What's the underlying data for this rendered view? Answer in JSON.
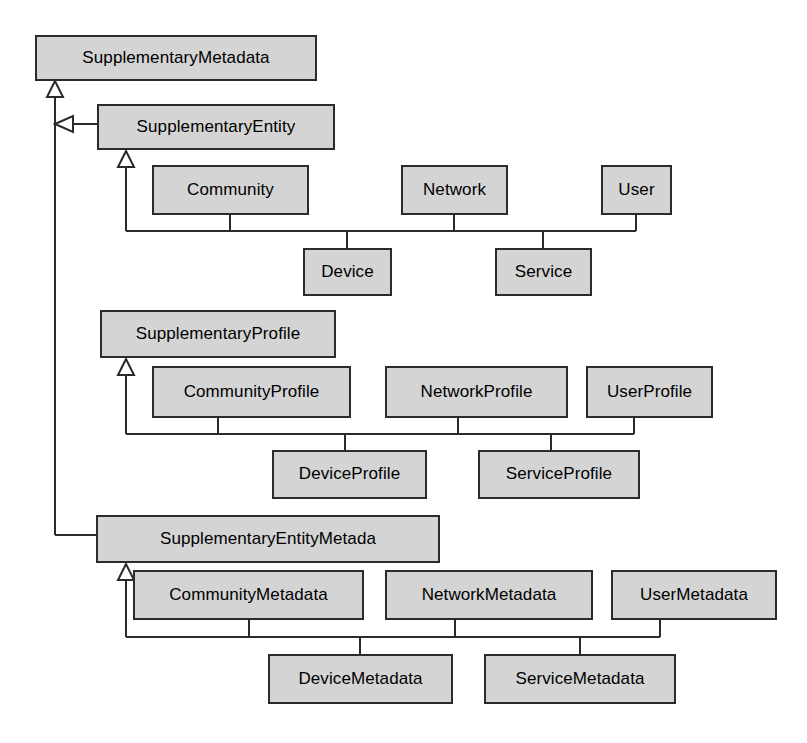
{
  "diagram": {
    "kind": "uml-class-diagram",
    "canvas": {
      "width": 807,
      "height": 743
    },
    "style": {
      "background": "#ffffff",
      "class_fill": "#d4d4d4",
      "class_border": "#2b2b2b",
      "edge_color": "#2b2b2b",
      "text_color": "#000000"
    },
    "classes": [
      {
        "id": "supplementary-metadata",
        "label": "SupplementaryMetadata",
        "x": 35,
        "y": 35,
        "w": 282,
        "h": 46
      },
      {
        "id": "supplementary-entity",
        "label": "SupplementaryEntity",
        "x": 97,
        "y": 104,
        "w": 238,
        "h": 46
      },
      {
        "id": "community",
        "label": "Community",
        "x": 152,
        "y": 165,
        "w": 157,
        "h": 50
      },
      {
        "id": "network",
        "label": "Network",
        "x": 401,
        "y": 165,
        "w": 107,
        "h": 50
      },
      {
        "id": "user",
        "label": "User",
        "x": 601,
        "y": 165,
        "w": 71,
        "h": 50
      },
      {
        "id": "device",
        "label": "Device",
        "x": 303,
        "y": 248,
        "w": 89,
        "h": 48
      },
      {
        "id": "service",
        "label": "Service",
        "x": 495,
        "y": 248,
        "w": 97,
        "h": 48
      },
      {
        "id": "supplementary-profile",
        "label": "SupplementaryProfile",
        "x": 100,
        "y": 310,
        "w": 236,
        "h": 48
      },
      {
        "id": "community-profile",
        "label": "CommunityProfile",
        "x": 152,
        "y": 366,
        "w": 199,
        "h": 52
      },
      {
        "id": "network-profile",
        "label": "NetworkProfile",
        "x": 385,
        "y": 366,
        "w": 183,
        "h": 52
      },
      {
        "id": "user-profile",
        "label": "UserProfile",
        "x": 586,
        "y": 366,
        "w": 127,
        "h": 52
      },
      {
        "id": "device-profile",
        "label": "DeviceProfile",
        "x": 272,
        "y": 450,
        "w": 155,
        "h": 49
      },
      {
        "id": "service-profile",
        "label": "ServiceProfile",
        "x": 478,
        "y": 450,
        "w": 162,
        "h": 49
      },
      {
        "id": "supplementary-entity-metada",
        "label": "SupplementaryEntityMetada",
        "x": 96,
        "y": 515,
        "w": 344,
        "h": 48
      },
      {
        "id": "community-metadata",
        "label": "CommunityMetadata",
        "x": 133,
        "y": 570,
        "w": 231,
        "h": 50
      },
      {
        "id": "network-metadata",
        "label": "NetworkMetadata",
        "x": 385,
        "y": 570,
        "w": 208,
        "h": 50
      },
      {
        "id": "user-metadata",
        "label": "UserMetadata",
        "x": 611,
        "y": 570,
        "w": 166,
        "h": 50
      },
      {
        "id": "device-metadata",
        "label": "DeviceMetadata",
        "x": 268,
        "y": 654,
        "w": 185,
        "h": 50
      },
      {
        "id": "service-metadata",
        "label": "ServiceMetadata",
        "x": 484,
        "y": 654,
        "w": 192,
        "h": 50
      }
    ],
    "generalizations": [
      {
        "parent": "supplementary-metadata",
        "children": [
          "supplementary-entity",
          "supplementary-entity-metada"
        ],
        "notation": "shared-target-tree"
      },
      {
        "parent": "supplementary-entity",
        "children": [
          "community",
          "network",
          "user",
          "device",
          "service"
        ],
        "notation": "shared-target-tree"
      },
      {
        "parent": "supplementary-profile",
        "children": [
          "community-profile",
          "network-profile",
          "user-profile",
          "device-profile",
          "service-profile"
        ],
        "notation": "shared-target-tree"
      },
      {
        "parent": "supplementary-entity-metada",
        "children": [
          "community-metadata",
          "network-metadata",
          "user-metadata",
          "device-metadata",
          "service-metadata"
        ],
        "notation": "shared-target-tree"
      }
    ]
  }
}
